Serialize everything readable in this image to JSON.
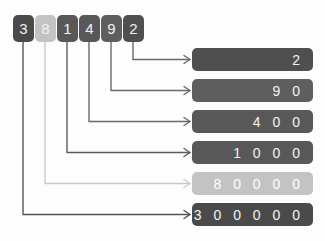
{
  "diagram": {
    "number": "381492",
    "background_color": "#fdfdfd",
    "colors": {
      "dark_slate": "#4d4d4d",
      "mid_gray": "#5e5e5e",
      "light_gray": "#c3c3c3",
      "line_dark": "#545454",
      "line_light": "#c9c9c9",
      "text_light": "#f2f2f2"
    },
    "digits": [
      {
        "label": "3",
        "place": "hundred-thousands",
        "color": "#4a4a4a",
        "line_color": "#545454",
        "tile_x": 13,
        "tile_y": 15,
        "line_x": 23,
        "elbow_y": 213
      },
      {
        "label": "8",
        "place": "ten-thousands",
        "color": "#c3c3c3",
        "line_color": "#c9c9c9",
        "tile_x": 35,
        "tile_y": 15,
        "line_x": 45,
        "elbow_y": 183
      },
      {
        "label": "1",
        "place": "thousands",
        "color": "#585858",
        "line_color": "#5d5d5d",
        "tile_x": 57,
        "tile_y": 15,
        "line_x": 67,
        "elbow_y": 153
      },
      {
        "label": "4",
        "place": "hundreds",
        "color": "#585858",
        "line_color": "#6a6a6a",
        "tile_x": 79,
        "tile_y": 15,
        "line_x": 89,
        "elbow_y": 122
      },
      {
        "label": "9",
        "place": "tens",
        "color": "#5e5e5e",
        "line_color": "#6a6a6a",
        "tile_x": 101,
        "tile_y": 15,
        "line_x": 111,
        "elbow_y": 91
      },
      {
        "label": "2",
        "place": "ones",
        "color": "#4f4f4f",
        "line_color": "#6a6a6a",
        "tile_x": 123,
        "tile_y": 15,
        "line_x": 133,
        "elbow_y": 60
      }
    ],
    "values": [
      {
        "text": "2",
        "place": "ones",
        "color": "#4f4f4f",
        "style": "dark",
        "y": 48
      },
      {
        "text": "9 0",
        "place": "tens",
        "color": "#5e5e5e",
        "style": "dark",
        "y": 79
      },
      {
        "text": "4 0 0",
        "place": "hundreds",
        "color": "#585858",
        "style": "dark",
        "y": 110
      },
      {
        "text": "1 0 0 0",
        "place": "thousands",
        "color": "#585858",
        "style": "dark",
        "y": 141
      },
      {
        "text": "8 0 0 0 0",
        "place": "ten-thousands",
        "color": "#c3c3c3",
        "style": "light",
        "y": 172
      },
      {
        "text": "3 0 0 0 0 0",
        "place": "hundred-thousands",
        "color": "#4a4a4a",
        "style": "dark",
        "y": 203
      }
    ],
    "box_geometry": {
      "x": 192,
      "width": 121,
      "height": 23
    },
    "arrow_x_end": 190,
    "arrow_color_dark": "#6a6a6a",
    "arrow_color_light": "#c9c9c9"
  },
  "chart_data": {
    "type": "diagram",
    "categories": [
      "hundred-thousands",
      "ten-thousands",
      "thousands",
      "hundreds",
      "tens",
      "ones"
    ],
    "digits": [
      3,
      8,
      1,
      4,
      9,
      2
    ],
    "values": [
      300000,
      80000,
      1000,
      400,
      90,
      2
    ],
    "value_labels": [
      "300000",
      "80000",
      "1000",
      "400",
      "90",
      "2"
    ],
    "total": 381492
  }
}
